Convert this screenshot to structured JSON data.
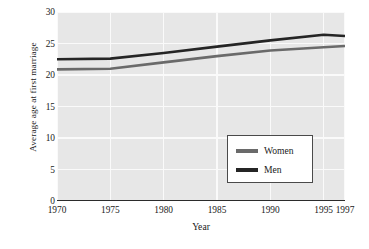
{
  "chart_data": {
    "type": "line",
    "title": "",
    "subtitle": "",
    "xlabel": "Year",
    "ylabel": "Average age at first marriage",
    "xlim": [
      1970,
      1997
    ],
    "ylim": [
      0,
      30
    ],
    "grid": true,
    "legend_position": "inside-lower-right",
    "x": [
      1970,
      1975,
      1980,
      1985,
      1990,
      1995,
      1997
    ],
    "xticks": [
      "1970",
      "1975",
      "1980",
      "1985",
      "1990",
      "1995",
      "1997"
    ],
    "yticks": [
      "0",
      "5",
      "10",
      "15",
      "20",
      "25",
      "30"
    ],
    "ytick_values": [
      0,
      5,
      10,
      15,
      20,
      25,
      30
    ],
    "series": [
      {
        "name": "Women",
        "color": "#6a6a6a",
        "values": [
          20.9,
          21.0,
          22.0,
          23.0,
          23.9,
          24.4,
          24.6
        ]
      },
      {
        "name": "Men",
        "color": "#252525",
        "values": [
          22.5,
          22.6,
          23.5,
          24.5,
          25.5,
          26.4,
          26.2
        ]
      }
    ],
    "plot_background": "#e7e7e7",
    "gridline_color": "#fafafa",
    "axis_color": "#2b2b2b"
  },
  "legend": {
    "entries": [
      {
        "label": "Women"
      },
      {
        "label": "Men"
      }
    ]
  }
}
